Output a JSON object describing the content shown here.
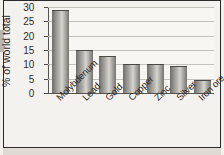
{
  "chart_data": {
    "type": "bar",
    "title": "",
    "subtitle": "",
    "xlabel": "",
    "ylabel": "% of world total",
    "ylim": [
      0,
      30
    ],
    "yticks": [
      0,
      5,
      10,
      15,
      20,
      25,
      30
    ],
    "ytick_labels": [
      "0",
      "5",
      "10",
      "15",
      "20",
      "25",
      "30"
    ],
    "grid": "horizontal",
    "legend": "none",
    "categories": [
      "Molybdenum",
      "Lead",
      "Gold",
      "Copper",
      "Zinc",
      "Silver",
      "Iron ore"
    ],
    "values": [
      29,
      15,
      13,
      10.2,
      10.2,
      9.5,
      4.5
    ],
    "colors": {
      "bar_fill_light": "#d7d5d0",
      "bar_fill_dark": "#6e6c69",
      "axis": "#555350",
      "gridline": "#c3c1bb",
      "plot_background": "#f7f6f2",
      "page_background": "#f4f2ee",
      "frame": "#2b2b2b",
      "text": "#2b2927"
    }
  }
}
